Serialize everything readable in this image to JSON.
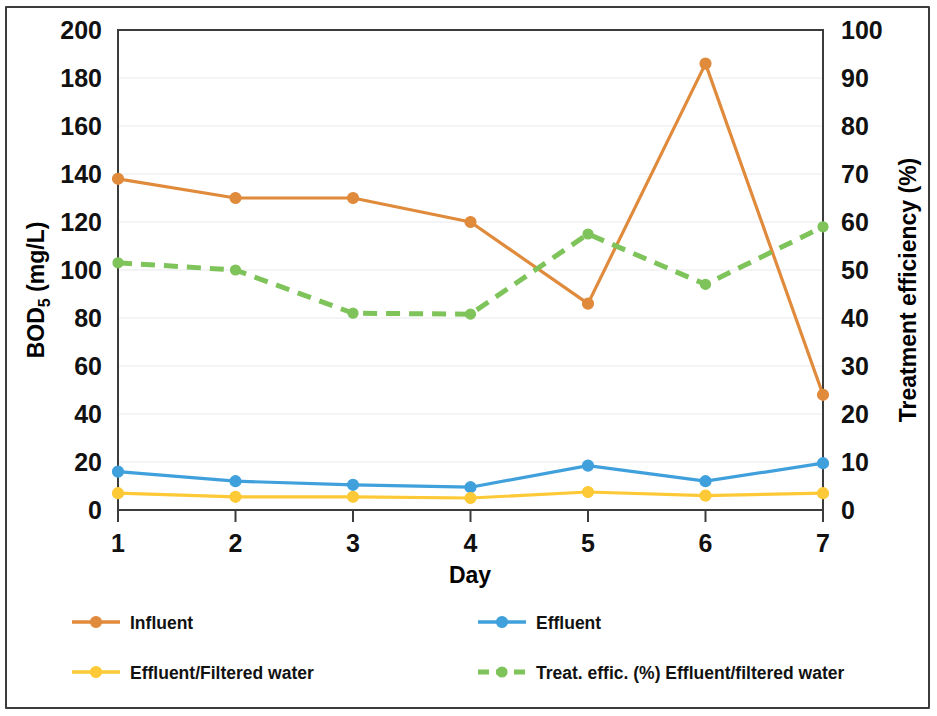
{
  "chart_data": {
    "type": "line",
    "title": "",
    "xlabel": "Day",
    "ylabel": "BOD5 (mg/L)",
    "ylabel_base": "BOD",
    "ylabel_sub": "5",
    "ylabel_unit": " (mg/L)",
    "y2label": "Treatment efficiency (%)",
    "x": [
      1,
      2,
      3,
      4,
      5,
      6,
      7
    ],
    "categories": [
      "1",
      "2",
      "3",
      "4",
      "5",
      "6",
      "7"
    ],
    "xlim": [
      1,
      7
    ],
    "ylim": [
      0,
      200
    ],
    "y2lim": [
      0,
      100
    ],
    "yticks": [
      0,
      20,
      40,
      60,
      80,
      100,
      120,
      140,
      160,
      180,
      200
    ],
    "ytick_labels": [
      "0",
      "20",
      "40",
      "60",
      "80",
      "100",
      "120",
      "140",
      "160",
      "180",
      "200"
    ],
    "y2ticks": [
      0,
      10,
      20,
      30,
      40,
      50,
      60,
      70,
      80,
      90,
      100
    ],
    "y2tick_labels": [
      "0",
      "10",
      "20",
      "30",
      "40",
      "50",
      "60",
      "70",
      "80",
      "90",
      "100"
    ],
    "grid": true,
    "grid_axis": "y",
    "legend_position": "bottom",
    "series": [
      {
        "name": "Influent",
        "axis": "left",
        "color": "#e08a3c",
        "style": "solid",
        "marker": "circle",
        "values": [
          138,
          130,
          130,
          120,
          86,
          186,
          48
        ]
      },
      {
        "name": "Effluent",
        "axis": "left",
        "color": "#3fa0dc",
        "style": "solid",
        "marker": "circle",
        "values": [
          16,
          12,
          10.5,
          9.5,
          18.5,
          12,
          19.5
        ]
      },
      {
        "name": "Effluent/Filtered water",
        "axis": "left",
        "color": "#fdc936",
        "style": "solid",
        "marker": "circle",
        "values": [
          7,
          5.5,
          5.5,
          5,
          7.5,
          6,
          7
        ]
      },
      {
        "name": "Treat. effic. (%) Effluent/filtered water",
        "axis": "right",
        "color": "#7fc35b",
        "style": "dashed",
        "marker": "circle",
        "values": [
          51.5,
          50,
          41,
          40.8,
          57.5,
          47,
          59
        ]
      }
    ]
  },
  "legend": {
    "entries": [
      {
        "label": "Influent",
        "color": "#e08a3c",
        "style": "solid"
      },
      {
        "label": "Effluent",
        "color": "#3fa0dc",
        "style": "solid"
      },
      {
        "label": "Effluent/Filtered water",
        "color": "#fdc936",
        "style": "solid"
      },
      {
        "label": "Treat. effic. (%) Effluent/filtered water",
        "color": "#7fc35b",
        "style": "dashed"
      }
    ]
  },
  "colors": {
    "influent": "#e08a3c",
    "effluent": "#3fa0dc",
    "filtered": "#fdc936",
    "efficiency": "#7fc35b",
    "axis": "#3c3c3c",
    "grid": "#e9e9ef",
    "text": "#111111"
  }
}
